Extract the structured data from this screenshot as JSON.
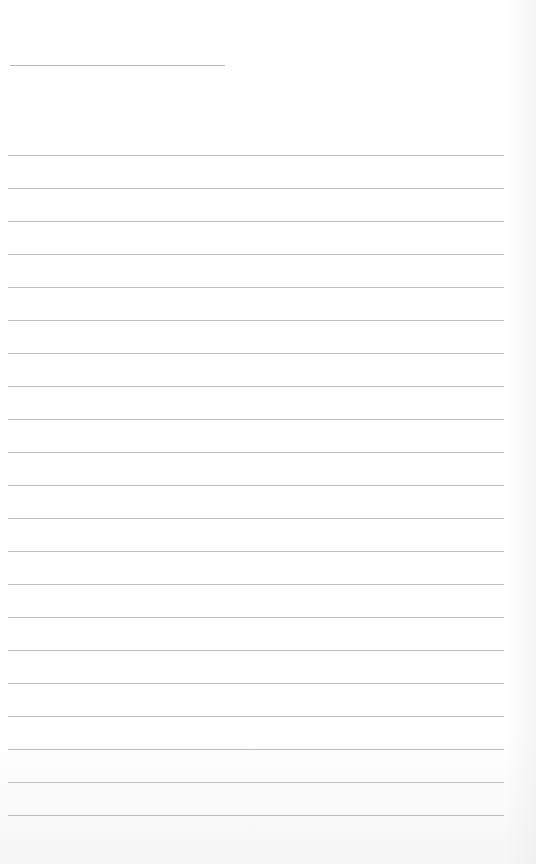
{
  "document": {
    "type": "lined-paper",
    "header_line": {
      "top": 65
    },
    "rules": {
      "count": 21,
      "first_top": 155,
      "spacing": 33,
      "color": "#bdbdbd"
    }
  }
}
